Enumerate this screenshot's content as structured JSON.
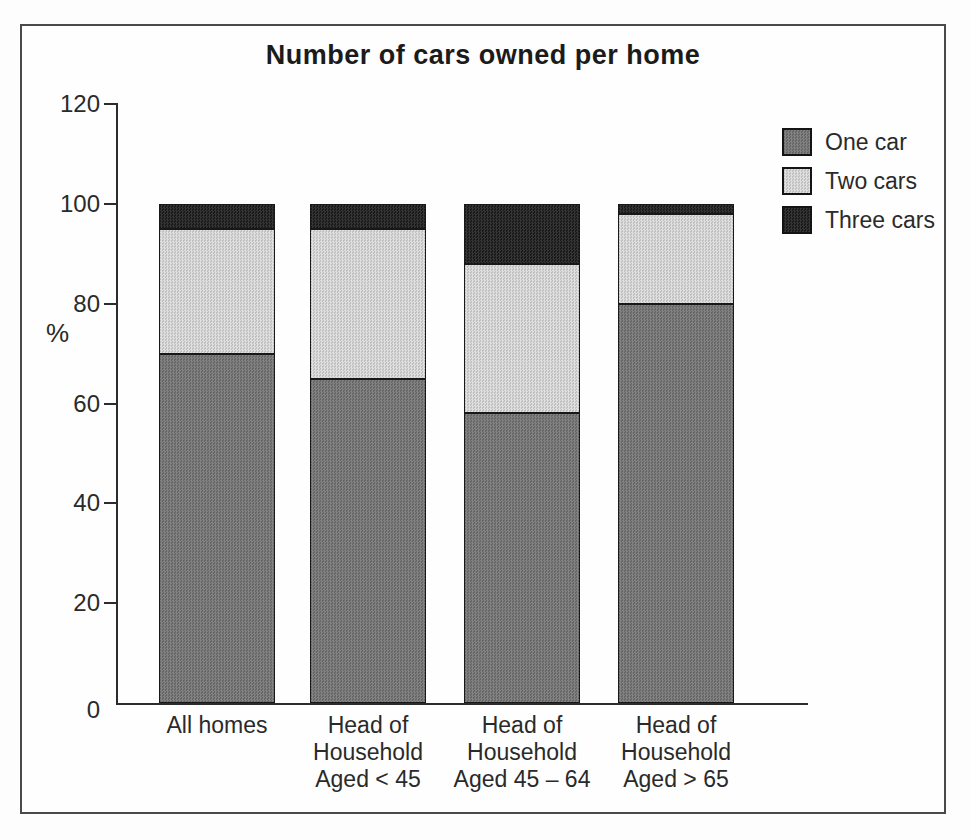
{
  "chart_data": {
    "type": "bar",
    "stacked": true,
    "title": "Number of cars owned per home",
    "ylabel": "%",
    "xlabel": "",
    "ylim": [
      0,
      120
    ],
    "yticks": [
      0,
      20,
      40,
      60,
      80,
      100,
      120
    ],
    "grid": false,
    "legend_position": "top-right",
    "categories": [
      "All homes",
      "Head of Household Aged < 45",
      "Head of Household Aged 45 – 64",
      "Head of Household Aged > 65"
    ],
    "category_label_lines": [
      [
        "All homes"
      ],
      [
        "Head of",
        "Household",
        "Aged < 45"
      ],
      [
        "Head of",
        "Household",
        "Aged 45 – 64"
      ],
      [
        "Head of",
        "Household",
        "Aged > 65"
      ]
    ],
    "series": [
      {
        "name": "One car",
        "values": [
          70,
          65,
          58,
          80
        ],
        "color": "#747474"
      },
      {
        "name": "Two cars",
        "values": [
          25,
          30,
          30,
          18
        ],
        "color": "#dbdbdb"
      },
      {
        "name": "Three cars",
        "values": [
          5,
          5,
          12,
          2
        ],
        "color": "#1d1d1d"
      }
    ],
    "colors": {
      "axis": "#2c2c2c",
      "frame_border": "#4a4a4a",
      "text": "#2a2a2a"
    }
  }
}
